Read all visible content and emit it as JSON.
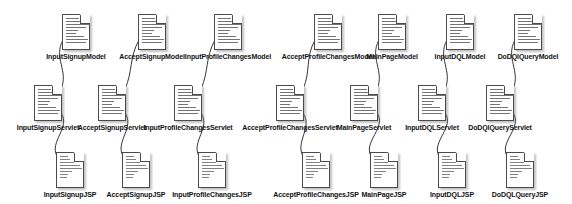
{
  "diagram": {
    "icon_names": {
      "document": "document-icon",
      "fold": "page-fold-corner-icon"
    },
    "colors": {
      "node_border": "#4a4a4a",
      "node_fill": "#ffffff",
      "edge": "#333333",
      "label_text": "#111111",
      "background": "#ffffff"
    },
    "rows": [
      {
        "name": "model-row",
        "y": 14,
        "nodes": [
          {
            "label": "InputSignupModel",
            "x": 76
          },
          {
            "label": "AcceptSignupModel",
            "x": 152
          },
          {
            "label": "InputProfileChangesModel",
            "x": 228
          },
          {
            "label": "AcceptProfileChangesModel",
            "x": 328
          },
          {
            "label": "MainPageModel",
            "x": 392
          },
          {
            "label": "InputDQLModel",
            "x": 460
          },
          {
            "label": "DoDQlQueryModel",
            "x": 528
          }
        ]
      },
      {
        "name": "servlet-row",
        "y": 85,
        "nodes": [
          {
            "label": "InputSignupServlet",
            "x": 48
          },
          {
            "label": "AcceptSignupServlet",
            "x": 112
          },
          {
            "label": "InputProfileChangesServlet",
            "x": 188
          },
          {
            "label": "AcceptProfileChangesServlet",
            "x": 290
          },
          {
            "label": "MainPageServlet",
            "x": 364
          },
          {
            "label": "InputDQLServlet",
            "x": 432
          },
          {
            "label": "DoDQlQueryServlet",
            "x": 500
          }
        ]
      },
      {
        "name": "jsp-row",
        "y": 152,
        "nodes": [
          {
            "label": "InputSignupJSP",
            "x": 70
          },
          {
            "label": "AcceptSignupJSP",
            "x": 136
          },
          {
            "label": "InputProfileChangesJSP",
            "x": 212
          },
          {
            "label": "AcceptProfileChangesJSP",
            "x": 316
          },
          {
            "label": "MainPageJSP",
            "x": 384
          },
          {
            "label": "InputDQLJSP",
            "x": 452
          },
          {
            "label": "DoDQLQueryJSP",
            "x": 520
          }
        ]
      }
    ],
    "edges": [
      {
        "from": "InputSignupServlet",
        "to": "InputSignupModel"
      },
      {
        "from": "AcceptSignupServlet",
        "to": "AcceptSignupModel"
      },
      {
        "from": "InputProfileChangesServlet",
        "to": "InputProfileChangesModel"
      },
      {
        "from": "AcceptProfileChangesServlet",
        "to": "AcceptProfileChangesModel"
      },
      {
        "from": "MainPageServlet",
        "to": "MainPageModel"
      },
      {
        "from": "InputDQLServlet",
        "to": "InputDQLModel"
      },
      {
        "from": "DoDQlQueryServlet",
        "to": "DoDQlQueryModel"
      },
      {
        "from": "InputSignupServlet",
        "to": "InputSignupJSP"
      },
      {
        "from": "AcceptSignupServlet",
        "to": "AcceptSignupJSP"
      },
      {
        "from": "InputProfileChangesServlet",
        "to": "InputProfileChangesJSP"
      },
      {
        "from": "AcceptProfileChangesServlet",
        "to": "AcceptProfileChangesJSP"
      },
      {
        "from": "MainPageServlet",
        "to": "MainPageJSP"
      },
      {
        "from": "InputDQLServlet",
        "to": "InputDQLJSP"
      },
      {
        "from": "DoDQlQueryServlet",
        "to": "DoDQLQueryJSP"
      }
    ]
  }
}
